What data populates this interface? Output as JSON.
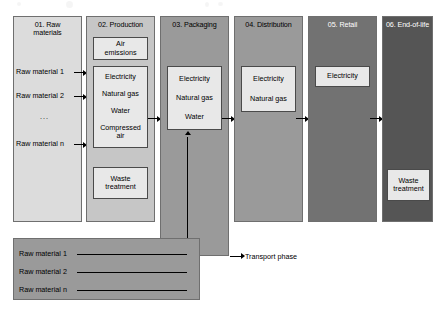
{
  "diagram": {
    "legend": {
      "label": "Transport phase",
      "icon": "arrow-right-icon"
    },
    "colors": {
      "stage_01": "#dcdcdc",
      "stage_02": "#c6c6c6",
      "stage_03": "#9a9a9a",
      "stage_04": "#9a9a9a",
      "stage_05": "#727272",
      "stage_06": "#555555",
      "transport_panel": "#9a9a9a",
      "box_fill": "#e8e8e8",
      "box_border": "#4a4a4a",
      "line": "#000000"
    },
    "stages": [
      {
        "id": "stage-01-raw-materials",
        "title": "01. Raw\nmaterials",
        "title_color": "light",
        "items": [
          {
            "label": "Raw material 1"
          },
          {
            "label": "Raw material 2"
          },
          {
            "label": "..."
          },
          {
            "label": "Raw material n"
          }
        ],
        "boxes": []
      },
      {
        "id": "stage-02-production",
        "title": "02. Production",
        "title_color": "light",
        "items": [],
        "boxes": [
          {
            "id": "box-air-emissions",
            "lines": [
              "Air\nemissions"
            ]
          },
          {
            "id": "box-production-inputs",
            "lines": [
              "Electricity",
              "Natural gas",
              "Water",
              "Compressed\nair"
            ]
          },
          {
            "id": "box-waste-treatment-production",
            "lines": [
              "Waste\ntreatment"
            ]
          }
        ]
      },
      {
        "id": "stage-03-packaging",
        "title": "03. Packaging",
        "title_color": "light",
        "items": [],
        "boxes": [
          {
            "id": "box-packaging-inputs",
            "lines": [
              "Electricity",
              "Natural gas",
              "Water"
            ]
          }
        ]
      },
      {
        "id": "stage-04-distribution",
        "title": "04. Distribution",
        "title_color": "light",
        "items": [],
        "boxes": [
          {
            "id": "box-distribution-inputs",
            "lines": [
              "Electricity",
              "Natural gas"
            ]
          }
        ]
      },
      {
        "id": "stage-05-retail",
        "title": "05. Retail",
        "title_color": "dark",
        "items": [],
        "boxes": [
          {
            "id": "box-retail-inputs",
            "lines": [
              "Electricity"
            ]
          }
        ]
      },
      {
        "id": "stage-06-end-of-life",
        "title": "06. End-of-life",
        "title_color": "dark",
        "items": [],
        "boxes": [
          {
            "id": "box-waste-treatment-eol",
            "lines": [
              "Waste\ntreatment"
            ]
          }
        ]
      }
    ],
    "transport": {
      "id": "transport-panel",
      "rows": [
        {
          "label": "Raw material 1"
        },
        {
          "label": "Raw material 2"
        },
        {
          "label": "Raw material n"
        }
      ]
    }
  }
}
